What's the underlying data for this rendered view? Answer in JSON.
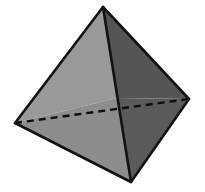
{
  "figure": {
    "name": "tetrahedron",
    "title": "Tetrahedron",
    "background_color": "#ffffff",
    "canvas": {
      "width": 205,
      "height": 192
    },
    "colors": {
      "edge_visible": "#121212",
      "edge_hidden": "#0d0d0d",
      "face_upper_left": "#999999",
      "face_lower_left": "#8d8d8d",
      "face_upper_right": "#555555",
      "face_lower_right": "#5a5a5a"
    },
    "vertices": [
      {
        "id": "apex",
        "label": "apex",
        "x": 103,
        "y": 7,
        "hidden": false
      },
      {
        "id": "left",
        "label": "left",
        "x": 15,
        "y": 123,
        "hidden": false
      },
      {
        "id": "right",
        "label": "right",
        "x": 189,
        "y": 99,
        "hidden": false
      },
      {
        "id": "bottom",
        "label": "bottom front",
        "x": 131,
        "y": 182,
        "hidden": false
      }
    ],
    "edges": [
      {
        "id": "apex-left",
        "from": "apex",
        "to": "left",
        "style": "solid"
      },
      {
        "id": "apex-right",
        "from": "apex",
        "to": "right",
        "style": "solid"
      },
      {
        "id": "apex-bottom",
        "from": "apex",
        "to": "bottom",
        "style": "solid"
      },
      {
        "id": "left-bottom",
        "from": "left",
        "to": "bottom",
        "style": "solid"
      },
      {
        "id": "right-bottom",
        "from": "right",
        "to": "bottom",
        "style": "solid"
      },
      {
        "id": "left-right",
        "from": "left",
        "to": "right",
        "style": "dashed"
      }
    ],
    "faces": [
      {
        "id": "upper-left",
        "points": "103,7 15,123 117,98",
        "fill": "#999999"
      },
      {
        "id": "lower-left",
        "points": "15,123 131,182 117,98",
        "fill": "#8d8d8d"
      },
      {
        "id": "upper-right",
        "points": "103,7 189,99 117,98",
        "fill": "#555555"
      },
      {
        "id": "lower-right",
        "points": "189,99 131,182 117,98",
        "fill": "#5a5a5a"
      }
    ],
    "crossing_point": {
      "x": 117,
      "y": 98
    }
  }
}
